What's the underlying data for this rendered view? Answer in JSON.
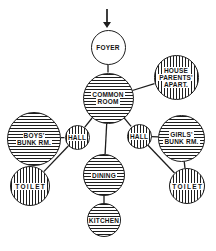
{
  "figure": {
    "background": "#ffffff",
    "line_color": "#1d1d1d"
  },
  "entrance_arrow": {
    "x": 107,
    "y_from": 9,
    "y_to": 28,
    "head_width": 8,
    "head_length": 6
  },
  "diagram": {
    "type": "bubble-diagram",
    "nodes": [
      {
        "id": "foyer",
        "lines": [
          "FOYER"
        ],
        "x": 108,
        "y": 47,
        "r": 17.5,
        "hatch": "none"
      },
      {
        "id": "common-room",
        "lines": [
          "COMMON",
          "ROOM"
        ],
        "x": 108,
        "y": 98,
        "r": 25.5,
        "hatch": "horizontal"
      },
      {
        "id": "house-parents-apart",
        "lines": [
          "HOUSE",
          "PARENTS'",
          "APART."
        ],
        "x": 176,
        "y": 77,
        "r": 22.5,
        "hatch": "vertical"
      },
      {
        "id": "boys-bunk-rm",
        "lines": [
          "BOYS'",
          "BUNK RM."
        ],
        "x": 34,
        "y": 139,
        "r": 27,
        "hatch": "horizontal"
      },
      {
        "id": "hall-left",
        "lines": [
          "HALL"
        ],
        "x": 77,
        "y": 137,
        "r": 12.5,
        "hatch": "vertical"
      },
      {
        "id": "hall-right",
        "lines": [
          "HALL"
        ],
        "x": 139,
        "y": 136,
        "r": 12.5,
        "hatch": "vertical"
      },
      {
        "id": "girls-bunk-rm",
        "lines": [
          "GIRLS'",
          "BUNK RM."
        ],
        "x": 181.5,
        "y": 138,
        "r": 23.5,
        "hatch": "horizontal"
      },
      {
        "id": "toilet-left",
        "lines": [
          "TOILET"
        ],
        "x": 30,
        "y": 186,
        "r": 20,
        "hatch": "vertical",
        "wide": true
      },
      {
        "id": "toilet-right",
        "lines": [
          "TOILET"
        ],
        "x": 187,
        "y": 186,
        "r": 18,
        "hatch": "vertical",
        "wide": true
      },
      {
        "id": "dining",
        "lines": [
          "DINING"
        ],
        "x": 104,
        "y": 175,
        "r": 21,
        "hatch": "horizontal"
      },
      {
        "id": "kitchen",
        "lines": [
          "KITCHEN"
        ],
        "x": 104,
        "y": 220,
        "r": 17,
        "hatch": "horizontal"
      }
    ],
    "edges": [
      [
        "foyer",
        "common-room"
      ],
      [
        "common-room",
        "house-parents-apart"
      ],
      [
        "common-room",
        "hall-left"
      ],
      [
        "common-room",
        "hall-right"
      ],
      [
        "common-room",
        "dining"
      ],
      [
        "hall-left",
        "boys-bunk-rm"
      ],
      [
        "hall-left",
        "toilet-left"
      ],
      [
        "boys-bunk-rm",
        "toilet-left"
      ],
      [
        "hall-right",
        "girls-bunk-rm"
      ],
      [
        "hall-right",
        "toilet-right"
      ],
      [
        "girls-bunk-rm",
        "toilet-right"
      ],
      [
        "dining",
        "kitchen"
      ]
    ]
  }
}
